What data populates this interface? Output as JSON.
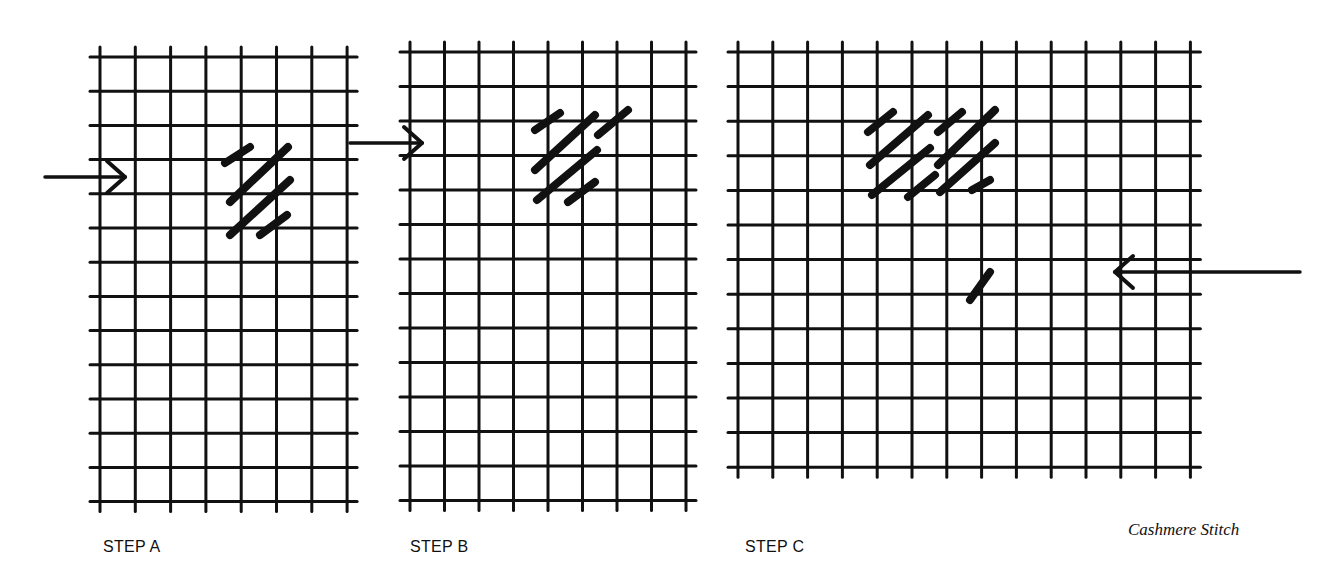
{
  "title": "Cashmere Stitch",
  "ink_color": "#111111",
  "background": "#ffffff",
  "panels": [
    {
      "id": "A",
      "label": "STEP A",
      "label_pos": [
        103,
        554
      ],
      "grid": {
        "x0": 100,
        "y0": 57,
        "cols": 7,
        "rows": 13,
        "dx": 35.3,
        "dy": 34.2
      },
      "arrow": {
        "direction": "right",
        "x1": 45,
        "y": 177,
        "x2": 125
      },
      "stitches": [
        [
          225,
          163,
          250,
          147
        ],
        [
          230,
          202,
          288,
          147
        ],
        [
          230,
          235,
          290,
          180
        ],
        [
          260,
          235,
          287,
          215
        ]
      ]
    },
    {
      "id": "B",
      "label": "STEP B",
      "label_pos": [
        410,
        554
      ],
      "grid": {
        "x0": 410,
        "y0": 52,
        "cols": 8,
        "rows": 13,
        "dx": 34.5,
        "dy": 34.5
      },
      "arrow": {
        "direction": "right",
        "x1": 350,
        "y": 143,
        "x2": 422
      },
      "stitches": [
        [
          535,
          130,
          560,
          113
        ],
        [
          535,
          170,
          595,
          115
        ],
        [
          598,
          135,
          628,
          110
        ],
        [
          537,
          200,
          597,
          150
        ],
        [
          568,
          202,
          595,
          182
        ]
      ]
    },
    {
      "id": "C",
      "label": "STEP C",
      "label_pos": [
        745,
        554
      ],
      "grid": {
        "x0": 738,
        "y0": 52,
        "cols": 13,
        "rows": 12,
        "dx": 34.8,
        "dy": 34.6
      },
      "arrow": {
        "direction": "left",
        "x1": 1300,
        "y": 272,
        "x2": 1115
      },
      "stitches": [
        [
          868,
          132,
          893,
          112
        ],
        [
          870,
          165,
          928,
          115
        ],
        [
          872,
          195,
          930,
          148
        ],
        [
          908,
          197,
          935,
          175
        ],
        [
          938,
          132,
          962,
          112
        ],
        [
          938,
          165,
          995,
          110
        ],
        [
          940,
          192,
          995,
          143
        ],
        [
          972,
          190,
          990,
          180
        ],
        [
          970,
          300,
          990,
          272
        ]
      ]
    }
  ],
  "caption": {
    "text": "Cashmere Stitch",
    "pos": [
      1130,
      535
    ]
  }
}
